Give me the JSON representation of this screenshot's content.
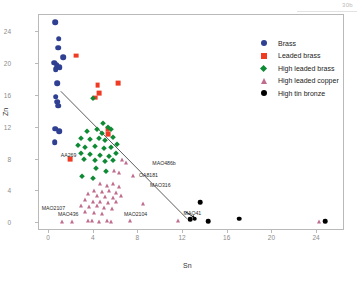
{
  "figure": {
    "corner_tag": "30b"
  },
  "axes": {
    "xlabel": "Sn",
    "ylabel": "Zn",
    "xticks": [
      "0",
      "4",
      "8",
      "12",
      "16",
      "20",
      "24"
    ],
    "yticks": [
      "0",
      "4",
      "8",
      "12",
      "16",
      "20",
      "24"
    ],
    "xlim": [
      -0.9,
      26.5
    ],
    "ylim": [
      -1.0,
      26.2
    ]
  },
  "legend": {
    "items": [
      {
        "label": "Brass",
        "marker": "circle",
        "color": "#2f3f91"
      },
      {
        "label": "Leaded brass",
        "marker": "square",
        "color": "#ef3b23"
      },
      {
        "label": "High leaded brass",
        "marker": "diamond",
        "color": "#0f8a34"
      },
      {
        "label": "High leaded copper",
        "marker": "triangle",
        "color": "#c06c8e"
      },
      {
        "label": "High tin bronze",
        "marker": "circle",
        "color": "#000000"
      }
    ]
  },
  "annotations": [
    {
      "text": "AA269",
      "x": 1.05,
      "y": 8.55
    },
    {
      "text": "MAO486b",
      "x": 9.25,
      "y": 7.55
    },
    {
      "text": "OA8181",
      "x": 8.05,
      "y": 6.1
    },
    {
      "text": "MAO316",
      "x": 9.05,
      "y": 4.85
    },
    {
      "text": "MAO2107",
      "x": -0.65,
      "y": 1.95
    },
    {
      "text": "MAO436",
      "x": 0.8,
      "y": 1.15
    },
    {
      "text": "MAO2104",
      "x": 6.7,
      "y": 1.2
    },
    {
      "text": "MAO41",
      "x": 12.05,
      "y": 1.25
    }
  ],
  "chart_data": {
    "type": "scatter",
    "title": "",
    "xlabel": "Sn",
    "ylabel": "Zn",
    "xlim": [
      -0.9,
      26.5
    ],
    "ylim": [
      -1.0,
      26.2
    ],
    "grid": false,
    "legend_position": "upper-right",
    "trendline": {
      "x1": 1.05,
      "y1": 16.6,
      "x2": 12.35,
      "y2": 0.55,
      "color": "#4a4a4a"
    },
    "series": [
      {
        "name": "Brass",
        "marker": "circle",
        "color": "#2f3f91",
        "points": [
          [
            0.55,
            25.3
          ],
          [
            0.85,
            23.2
          ],
          [
            0.8,
            22.1
          ],
          [
            1.25,
            20.9
          ],
          [
            0.45,
            20.2
          ],
          [
            0.7,
            19.9
          ],
          [
            0.6,
            19.4
          ],
          [
            0.95,
            19.6
          ],
          [
            0.75,
            17.6
          ],
          [
            0.6,
            15.9
          ],
          [
            0.75,
            15.3
          ],
          [
            0.8,
            14.8
          ],
          [
            0.55,
            11.9
          ],
          [
            0.9,
            11.6
          ],
          [
            0.5,
            10.2
          ]
        ]
      },
      {
        "name": "Leaded brass",
        "marker": "square",
        "color": "#ef3b23",
        "points": [
          [
            2.45,
            21.1
          ],
          [
            4.35,
            17.4
          ],
          [
            6.15,
            17.6
          ],
          [
            4.5,
            16.4
          ],
          [
            4.1,
            15.8
          ],
          [
            5.25,
            11.8
          ],
          [
            5.3,
            11.2
          ],
          [
            1.9,
            8.1
          ]
        ]
      },
      {
        "name": "High leaded brass",
        "marker": "diamond",
        "color": "#0f8a34",
        "points": [
          [
            3.95,
            15.8
          ],
          [
            4.85,
            12.6
          ],
          [
            5.25,
            12.1
          ],
          [
            4.3,
            11.9
          ],
          [
            3.4,
            11.6
          ],
          [
            4.75,
            11.4
          ],
          [
            5.55,
            11.8
          ],
          [
            2.9,
            10.7
          ],
          [
            3.65,
            10.6
          ],
          [
            4.45,
            10.7
          ],
          [
            5.05,
            10.4
          ],
          [
            5.7,
            10.8
          ],
          [
            2.55,
            9.8
          ],
          [
            3.25,
            9.6
          ],
          [
            4.15,
            9.7
          ],
          [
            4.9,
            9.5
          ],
          [
            5.55,
            9.6
          ],
          [
            6.05,
            9.9
          ],
          [
            2.9,
            8.8
          ],
          [
            3.7,
            8.7
          ],
          [
            4.55,
            8.6
          ],
          [
            5.35,
            8.5
          ],
          [
            6.0,
            8.8
          ],
          [
            3.1,
            8.1
          ],
          [
            4.1,
            7.9
          ],
          [
            5.0,
            7.8
          ],
          [
            5.7,
            8.0
          ],
          [
            4.2,
            6.9
          ],
          [
            5.1,
            6.6
          ],
          [
            2.95,
            5.9
          ],
          [
            3.95,
            5.7
          ]
        ]
      },
      {
        "name": "High leaded copper",
        "marker": "triangle",
        "color": "#c06c8e",
        "points": [
          [
            6.55,
            7.9
          ],
          [
            6.9,
            7.6
          ],
          [
            5.85,
            6.6
          ],
          [
            6.3,
            6.3
          ],
          [
            7.55,
            5.9
          ],
          [
            4.55,
            4.9
          ],
          [
            5.15,
            4.7
          ],
          [
            5.75,
            4.9
          ],
          [
            6.25,
            4.6
          ],
          [
            4.05,
            4.1
          ],
          [
            4.7,
            3.9
          ],
          [
            5.35,
            4.0
          ],
          [
            6.0,
            3.8
          ],
          [
            3.45,
            3.6
          ],
          [
            4.25,
            3.4
          ],
          [
            5.0,
            3.3
          ],
          [
            5.7,
            3.2
          ],
          [
            6.45,
            3.4
          ],
          [
            3.2,
            2.9
          ],
          [
            3.9,
            2.7
          ],
          [
            4.6,
            2.6
          ],
          [
            5.3,
            2.5
          ],
          [
            5.95,
            2.7
          ],
          [
            2.85,
            2.2
          ],
          [
            3.55,
            2.0
          ],
          [
            4.25,
            2.1
          ],
          [
            4.95,
            1.9
          ],
          [
            5.6,
            1.8
          ],
          [
            3.25,
            1.4
          ],
          [
            4.0,
            1.3
          ],
          [
            4.7,
            1.2
          ],
          [
            8.45,
            2.4
          ],
          [
            1.15,
            0.15
          ],
          [
            2.05,
            0.15
          ],
          [
            3.45,
            0.2
          ],
          [
            3.85,
            0.2
          ],
          [
            4.45,
            0.15
          ],
          [
            5.15,
            0.2
          ],
          [
            5.55,
            0.15
          ],
          [
            7.25,
            0.2
          ],
          [
            11.55,
            0.25
          ],
          [
            24.15,
            0.15
          ]
        ]
      },
      {
        "name": "High tin bronze",
        "marker": "circle",
        "color": "#000000",
        "points": [
          [
            13.55,
            2.6
          ],
          [
            13.05,
            0.55
          ],
          [
            12.65,
            0.45
          ],
          [
            14.25,
            0.25
          ],
          [
            17.05,
            0.55
          ],
          [
            24.75,
            0.25
          ]
        ]
      }
    ]
  }
}
